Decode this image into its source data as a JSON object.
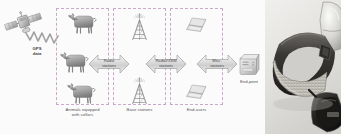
{
  "diagram": {
    "source_node": {
      "icon": "satellite-icon",
      "label": "GPS\ndata"
    },
    "groups": [
      {
        "id": "animals",
        "caption": "Animals equipped\nwith collars",
        "icon": "goat-icon",
        "item_count": 3
      },
      {
        "id": "base-stations",
        "caption": "Base stations",
        "icon": "radio-tower-icon",
        "item_count": 2
      },
      {
        "id": "end-users",
        "caption": "End-users",
        "icon": "laptop-icon",
        "item_count": 2
      }
    ],
    "links": [
      {
        "id": "link-1",
        "label": "Radio\nstations"
      },
      {
        "id": "link-2",
        "label": "Radio/GSM\nstations"
      },
      {
        "id": "link-3",
        "label": "Misc.\nstations"
      }
    ],
    "endpoint": {
      "icon": "server-icon",
      "label": "End-point"
    }
  },
  "photo": {
    "alt": "GPS tracking collar with electronics module",
    "subject": "gps-collar"
  },
  "colors": {
    "dashed_border": "#c9a9c9",
    "arrow_fill": "#d8d8d8",
    "arrow_stroke": "#8f8f8f",
    "text": "#555555",
    "background": "#fbfbfb"
  }
}
